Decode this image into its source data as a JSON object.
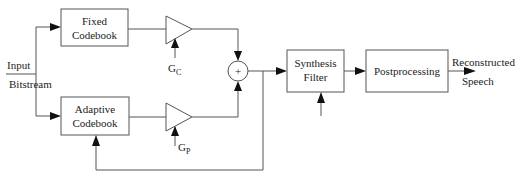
{
  "diagram": {
    "input_label_line1": "Input",
    "input_label_line2": "Bitstream",
    "fixed_codebook": {
      "line1": "Fixed",
      "line2": "Codebook"
    },
    "adaptive_codebook": {
      "line1": "Adaptive",
      "line2": "Codebook"
    },
    "gain_fixed": {
      "main": "G",
      "sub": "C"
    },
    "gain_adaptive": {
      "main": "G",
      "sub": "P"
    },
    "sum_symbol": "+",
    "synthesis_filter": {
      "line1": "Synthesis",
      "line2": "Filter"
    },
    "postprocessing": {
      "label": "Postprocessing"
    },
    "output_label_line1": "Reconstructed",
    "output_label_line2": "Speech"
  },
  "colors": {
    "line": "#555555",
    "arrow": "#111111",
    "text": "#222222",
    "background": "#ffffff"
  }
}
